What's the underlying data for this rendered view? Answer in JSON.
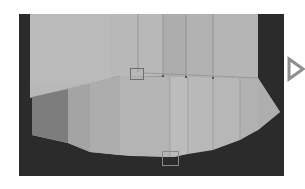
{
  "viewport": {
    "background_color": "#2a2a2a",
    "surface_top_color": "#b9b9b9",
    "surface_lower_colors": [
      "#7e7e7e",
      "#a9a9a9",
      "#b0b0b0",
      "#b6b6b6",
      "#bdbdbd",
      "#bababa",
      "#b7b7b7",
      "#b3b3b3",
      "#afafaf"
    ],
    "edge_line_color": "#8c8c8c",
    "vertex_color": "#3a3a3a"
  },
  "handles": [
    {
      "name": "selection-handle-top",
      "x": 130,
      "y": 68,
      "w": 14,
      "h": 12,
      "color": "#6f6f6f"
    },
    {
      "name": "selection-handle-bottom",
      "x": 162,
      "y": 151,
      "w": 17,
      "h": 15,
      "color": "#8a8a8a"
    }
  ],
  "play_button": {
    "icon": "play-triangle-icon",
    "color": "#8f8f8f"
  }
}
